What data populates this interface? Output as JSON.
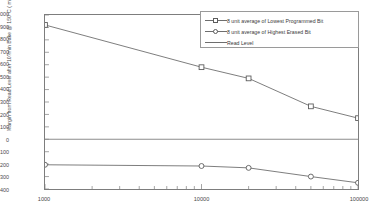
{
  "chart_data": {
    "type": "line",
    "title": "",
    "xlabel": "",
    "ylabel": "Margin from Read Level after 10?min Bake @ 150°C ( mV)",
    "xscale": "log",
    "xlim": [
      1000,
      100000
    ],
    "ylim": [
      -400,
      1000
    ],
    "grid": false,
    "legend_position": "top-right",
    "x_ticks": [
      "1000",
      "10000",
      "100000"
    ],
    "x_tick_values": [
      1000,
      10000,
      100000
    ],
    "y_ticks": [
      "1000",
      "900",
      "800",
      "700",
      "600",
      "500",
      "400",
      "300",
      "200",
      "100",
      "0",
      "-100",
      "-200",
      "-300",
      "-400"
    ],
    "y_tick_values": [
      1000,
      900,
      800,
      700,
      600,
      500,
      400,
      300,
      200,
      100,
      0,
      -100,
      -200,
      -300,
      -400
    ],
    "series": [
      {
        "name": "8 unit average of Lowest Programmed Bit",
        "marker": "square",
        "color": "#6e6e6e",
        "x": [
          1000,
          10000,
          20000,
          50000,
          100000
        ],
        "values": [
          920,
          580,
          490,
          265,
          170
        ]
      },
      {
        "name": "8 unit average of Highest Erased Bit",
        "marker": "circle",
        "color": "#6e6e6e",
        "x": [
          1000,
          10000,
          20000,
          50000,
          100000
        ],
        "values": [
          -205,
          -215,
          -230,
          -300,
          -350
        ]
      },
      {
        "name": "Read Level",
        "marker": "none",
        "color": "#8c8c8c",
        "x": [
          1000,
          100000
        ],
        "values": [
          0,
          0
        ]
      }
    ]
  },
  "legend": {
    "items": [
      {
        "label": "8 unit average of Lowest Programmed Bit"
      },
      {
        "label": "8 unit average of Highest Erased Bit"
      },
      {
        "label": "Read Level"
      }
    ]
  }
}
